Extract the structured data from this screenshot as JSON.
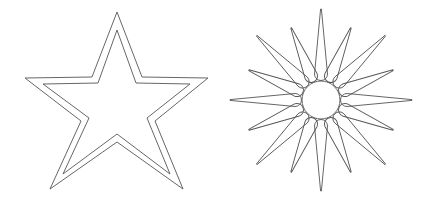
{
  "canvas": {
    "width": 435,
    "height": 202,
    "background": "#ffffff"
  },
  "stroke": {
    "color": "#555555",
    "width": 0.9
  },
  "shapes": {
    "star": {
      "label": "outlined five-pointed star",
      "outer_points": "117,12 142,77 208,78 155,121 183,189 117,142 50,189 81,121 25,78 92,77",
      "inner_points": "117,30 136,83 190,84 147,118 170,174 117,134 63,174 89,118 43,84 98,83"
    },
    "sun": {
      "label": "sun with circle and sixteen rays",
      "center": {
        "x": 321,
        "y": 100
      },
      "circle_radius": 19,
      "ray_count": 16,
      "ray_inner_radius": 26,
      "long_ray_length": 91,
      "short_ray_length": 78,
      "ray_base_half_width": 6.5
    }
  }
}
